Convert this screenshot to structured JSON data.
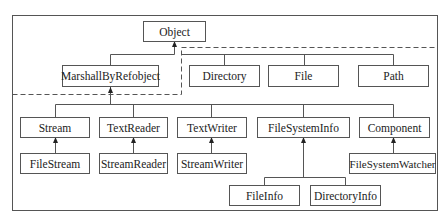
{
  "diagram": {
    "nodes": {
      "object": "Object",
      "marshall": "MarshallByRefobject",
      "directory": "Directory",
      "file": "File",
      "path": "Path",
      "stream": "Stream",
      "textreader": "TextReader",
      "textwriter": "TextWriter",
      "filesysteminfo": "FileSystemInfo",
      "component": "Component",
      "filestream": "FileStream",
      "streamreader": "StreamReader",
      "streamwriter": "StreamWriter",
      "filesystemwatcher": "FileSystemWatcher",
      "fileinfo": "FileInfo",
      "directoryinfo": "DirectoryInfo"
    },
    "colors": {
      "line": "#555555",
      "text": "#222222",
      "background": "#ffffff"
    }
  }
}
